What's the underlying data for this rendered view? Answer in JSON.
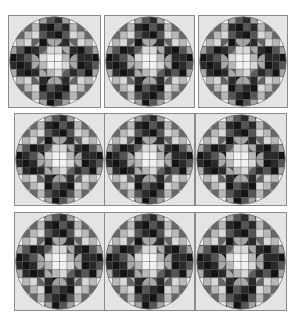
{
  "figure": {
    "rows": 3,
    "cols": 3,
    "grid_size": 12,
    "colors": {
      "background": "#ffffff",
      "panel_fill": "#e4e4e4",
      "grid_line": "#3a3a3a",
      "circle_outline": "#6e6e6e",
      "shades": {
        "0": "#f2f2f2",
        "1": "#d8d8d8",
        "2": "#b8b8b8",
        "3": "#8c8c8c",
        "4": "#555555",
        "5": "#2a2a2a",
        "6": "#141414"
      }
    },
    "panels": [
      {
        "row": 0,
        "col": 0,
        "x": 8,
        "y": 15,
        "w": 93,
        "h": 93
      },
      {
        "row": 0,
        "col": 1,
        "x": 104,
        "y": 15,
        "w": 91,
        "h": 93
      },
      {
        "row": 0,
        "col": 2,
        "x": 198,
        "y": 15,
        "w": 90,
        "h": 93
      },
      {
        "row": 1,
        "col": 0,
        "x": 14,
        "y": 113,
        "w": 91,
        "h": 93
      },
      {
        "row": 1,
        "col": 1,
        "x": 104,
        "y": 113,
        "w": 91,
        "h": 93
      },
      {
        "row": 1,
        "col": 2,
        "x": 195,
        "y": 113,
        "w": 92,
        "h": 93
      },
      {
        "row": 2,
        "col": 0,
        "x": 14,
        "y": 212,
        "w": 91,
        "h": 99
      },
      {
        "row": 2,
        "col": 1,
        "x": 104,
        "y": 212,
        "w": 91,
        "h": 99
      },
      {
        "row": 2,
        "col": 2,
        "x": 195,
        "y": 212,
        "w": 92,
        "h": 99
      }
    ],
    "pattern": [
      [
        0,
        0,
        0,
        0,
        5,
        4,
        5,
        6,
        0,
        0,
        0,
        0
      ],
      [
        0,
        0,
        1,
        2,
        5,
        6,
        4,
        5,
        2,
        1,
        0,
        0
      ],
      [
        0,
        1,
        2,
        1,
        4,
        5,
        6,
        4,
        1,
        2,
        1,
        0
      ],
      [
        0,
        2,
        1,
        2,
        6,
        4,
        5,
        5,
        2,
        1,
        2,
        0
      ],
      [
        5,
        4,
        6,
        5,
        3,
        1,
        1,
        4,
        5,
        6,
        4,
        5
      ],
      [
        6,
        5,
        4,
        6,
        1,
        0,
        0,
        2,
        6,
        5,
        5,
        6
      ],
      [
        5,
        6,
        5,
        4,
        2,
        0,
        0,
        1,
        4,
        6,
        5,
        4
      ],
      [
        4,
        5,
        6,
        5,
        4,
        2,
        1,
        3,
        5,
        4,
        6,
        5
      ],
      [
        0,
        2,
        1,
        2,
        5,
        6,
        4,
        5,
        2,
        1,
        2,
        0
      ],
      [
        0,
        1,
        2,
        1,
        6,
        4,
        5,
        6,
        1,
        2,
        1,
        0
      ],
      [
        0,
        0,
        1,
        2,
        4,
        5,
        6,
        4,
        2,
        1,
        0,
        0
      ],
      [
        0,
        0,
        0,
        0,
        5,
        6,
        4,
        5,
        0,
        0,
        0,
        0
      ]
    ],
    "quarter_circles": [
      [
        1,
        2,
        "tl"
      ],
      [
        2,
        1,
        "tl"
      ],
      [
        1,
        9,
        "tr"
      ],
      [
        2,
        10,
        "tr"
      ],
      [
        9,
        1,
        "bl"
      ],
      [
        10,
        2,
        "bl"
      ],
      [
        9,
        10,
        "br"
      ],
      [
        10,
        9,
        "br"
      ],
      [
        3,
        3,
        "br"
      ],
      [
        3,
        8,
        "bl"
      ],
      [
        8,
        3,
        "tr"
      ],
      [
        8,
        8,
        "tl"
      ],
      [
        4,
        0,
        "tl"
      ],
      [
        7,
        0,
        "bl"
      ],
      [
        4,
        11,
        "tr"
      ],
      [
        7,
        11,
        "br"
      ],
      [
        0,
        4,
        "tl"
      ],
      [
        0,
        7,
        "tr"
      ],
      [
        11,
        4,
        "bl"
      ],
      [
        11,
        7,
        "br"
      ],
      [
        4,
        4,
        "br"
      ],
      [
        4,
        7,
        "bl"
      ],
      [
        7,
        4,
        "tr"
      ],
      [
        7,
        7,
        "tl"
      ],
      [
        5,
        3,
        "tr"
      ],
      [
        6,
        3,
        "br"
      ],
      [
        5,
        8,
        "tl"
      ],
      [
        6,
        8,
        "bl"
      ],
      [
        3,
        5,
        "bl"
      ],
      [
        3,
        6,
        "br"
      ],
      [
        8,
        5,
        "tl"
      ],
      [
        8,
        6,
        "tr"
      ]
    ]
  }
}
